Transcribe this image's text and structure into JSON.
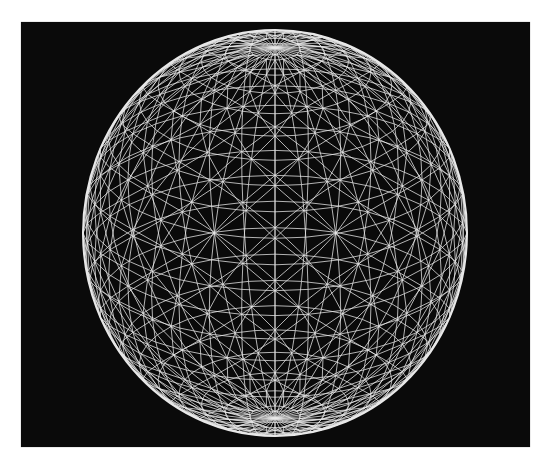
{
  "figure": {
    "background_color": "#0a0a0a",
    "line_color": "#e8e8e8",
    "page_color": "#ffffff"
  },
  "sphere": {
    "center_x": 275,
    "center_y": 233,
    "radius_x": 192,
    "radius_y": 203,
    "latitude_bands": 24,
    "longitude_segments": 36,
    "tilt_degrees": 24,
    "triangulated": true
  }
}
